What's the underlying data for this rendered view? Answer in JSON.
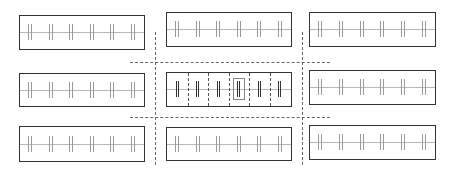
{
  "diagram": {
    "colors": {
      "border": "#333333",
      "tick": "#9a9a9a",
      "tick_bold": "#333333",
      "axis": "#b8b8b8",
      "dashed": "#666666",
      "background": "#ffffff"
    },
    "ticks_per_panel": 6,
    "panels": [
      {
        "id": "top-left",
        "x": 19,
        "y": 15,
        "w": 126,
        "h": 35,
        "center": false
      },
      {
        "id": "top-center",
        "x": 166,
        "y": 12,
        "w": 126,
        "h": 35,
        "center": false
      },
      {
        "id": "top-right",
        "x": 309,
        "y": 12,
        "w": 127,
        "h": 35,
        "center": false
      },
      {
        "id": "middle-left",
        "x": 19,
        "y": 73,
        "w": 126,
        "h": 34,
        "center": false
      },
      {
        "id": "middle-center",
        "x": 166,
        "y": 72,
        "w": 126,
        "h": 35,
        "center": true,
        "highlighted_cell": 4
      },
      {
        "id": "middle-right",
        "x": 309,
        "y": 70,
        "w": 127,
        "h": 35,
        "center": false
      },
      {
        "id": "bottom-left",
        "x": 19,
        "y": 126,
        "w": 126,
        "h": 36,
        "center": false
      },
      {
        "id": "bottom-center",
        "x": 166,
        "y": 127,
        "w": 126,
        "h": 34,
        "center": false
      },
      {
        "id": "bottom-right",
        "x": 309,
        "y": 125,
        "w": 127,
        "h": 35,
        "center": false
      }
    ],
    "dashed_lines": {
      "vertical": [
        {
          "x": 155,
          "y1": 32,
          "y2": 165
        },
        {
          "x": 302,
          "y1": 32,
          "y2": 165
        }
      ],
      "horizontal": [
        {
          "y": 62,
          "x1": 130,
          "x2": 330
        },
        {
          "y": 117,
          "x1": 130,
          "x2": 330
        }
      ]
    }
  }
}
